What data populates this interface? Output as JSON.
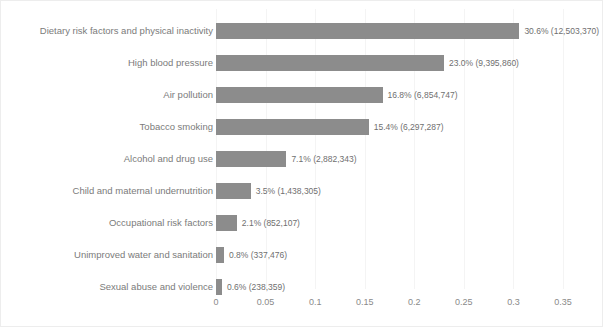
{
  "chart_data": {
    "type": "bar",
    "orientation": "horizontal",
    "title": "",
    "subtitle": "",
    "xlabel": "",
    "ylabel": "",
    "xlim": [
      0,
      0.3675
    ],
    "grid": "vertical-faint",
    "legend": "none",
    "bar_color": "#8c8c8c",
    "background_color": "#ffffff",
    "tick_labels": [
      "0",
      "0.05",
      "0.1",
      "0.15",
      "0.2",
      "0.25",
      "0.3",
      "0.35"
    ],
    "tick_values": [
      0,
      0.05,
      0.1,
      0.15,
      0.2,
      0.25,
      0.3,
      0.35
    ],
    "categories": [
      "Dietary risk factors and physical inactivity",
      "High blood pressure",
      "Air pollution",
      "Tobacco smoking",
      "Alcohol and drug use",
      "Child and maternal undernutrition",
      "Occupational risk factors",
      "Unimproved water and sanitation",
      "Sexual abuse and violence"
    ],
    "values": [
      0.306,
      0.23,
      0.168,
      0.154,
      0.071,
      0.035,
      0.021,
      0.008,
      0.006
    ],
    "counts": [
      12503370,
      9395860,
      6854747,
      6297287,
      2882343,
      1438305,
      852107,
      337476,
      238359
    ],
    "data_labels": [
      "30.6% (12,503,370)",
      "23.0% (9,395,860)",
      "16.8% (6,854,747)",
      "15.4% (6,297,287)",
      "7.1% (2,882,343)",
      "3.5% (1,438,305)",
      "2.1% (852,107)",
      "0.8% (337,476)",
      "0.6% (238,359)"
    ],
    "bars": [
      {
        "category": "Dietary risk factors and physical inactivity",
        "value": 0.306,
        "count": 12503370,
        "label": "30.6% (12,503,370)"
      },
      {
        "category": "High blood pressure",
        "value": 0.23,
        "count": 9395860,
        "label": "23.0% (9,395,860)"
      },
      {
        "category": "Air pollution",
        "value": 0.168,
        "count": 6854747,
        "label": "16.8% (6,854,747)"
      },
      {
        "category": "Tobacco smoking",
        "value": 0.154,
        "count": 6297287,
        "label": "15.4% (6,297,287)"
      },
      {
        "category": "Alcohol and drug use",
        "value": 0.071,
        "count": 2882343,
        "label": "7.1% (2,882,343)"
      },
      {
        "category": "Child and maternal undernutrition",
        "value": 0.035,
        "count": 1438305,
        "label": "3.5% (1,438,305)"
      },
      {
        "category": "Occupational risk factors",
        "value": 0.021,
        "count": 852107,
        "label": "2.1% (852,107)"
      },
      {
        "category": "Unimproved water and sanitation",
        "value": 0.008,
        "count": 337476,
        "label": "0.8% (337,476)"
      },
      {
        "category": "Sexual abuse and violence",
        "value": 0.006,
        "count": 238359,
        "label": "0.6% (238,359)"
      }
    ]
  }
}
